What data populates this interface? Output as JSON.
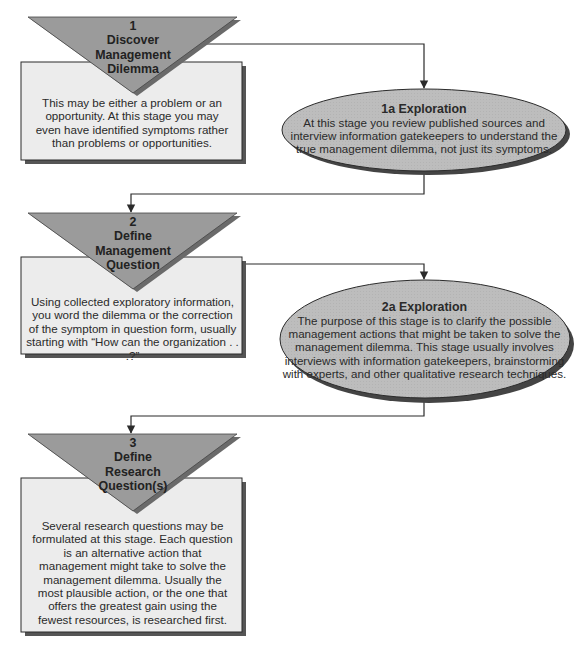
{
  "colors": {
    "triangle_fill": "#9b9b9b",
    "box_fill": "#ececec",
    "ellipse_fill": "#bdbdbd",
    "shadow": "#555555",
    "line": "#2b2b2b"
  },
  "stages": [
    {
      "number": "1",
      "title_line1": "Discover",
      "title_line2": "Management",
      "title_line3": "Dilemma",
      "description": "This may be either a problem or an opportunity.  At this stage you may even have identified symptoms rather than problems or opportunities."
    },
    {
      "number": "2",
      "title_line1": "Define",
      "title_line2": "Management",
      "title_line3": "Question",
      "description": "Using collected exploratory information, you word the dilemma or the correction of the symptom in question form, usually starting with “How can the organization . . .?”"
    },
    {
      "number": "3",
      "title_line1": "Define",
      "title_line2": "Research",
      "title_line3": "Question(s)",
      "description": "Several research questions may be formulated at this stage.  Each question is an alternative action that management might take to solve the management dilemma.  Usually the most plausible action, or the one that offers the greatest gain using the fewest resources, is researched first."
    }
  ],
  "explorations": [
    {
      "title": "1a Exploration",
      "description": "At this stage you review published sources and interview information gatekeepers to understand the true management dilemma, not just its symptoms."
    },
    {
      "title": "2a Exploration",
      "description": "The purpose of this stage is to clarify the possible management actions that might be taken to solve the management dilemma.  This stage usually involves interviews with information gatekeepers, brainstorming with experts, and other qualitative research techniques."
    }
  ]
}
